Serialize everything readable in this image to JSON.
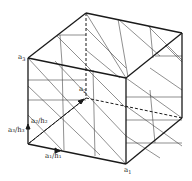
{
  "diagram": {
    "type": "cube-lattice-planes",
    "stroke_color": "#1a1a1a",
    "thin_stroke_color": "#444444",
    "vertices": {
      "top_back": [
        86,
        13
      ],
      "top_right": [
        182,
        33
      ],
      "top_left": [
        28,
        58
      ],
      "top_front": [
        126,
        78
      ],
      "bottom_back": [
        86,
        98
      ],
      "bottom_right": [
        182,
        118
      ],
      "bottom_left": [
        28,
        144
      ],
      "bottom_front": [
        126,
        164
      ]
    },
    "labels": {
      "a3": "a",
      "a3_sub": "3",
      "a2": "a",
      "a2_sub": "2",
      "a1": "a",
      "a1_sub": "1",
      "a3_h3": "a₃/h₃",
      "a2_h2": "a₂/h₂",
      "a1_h1": "a₁/h₁"
    }
  }
}
